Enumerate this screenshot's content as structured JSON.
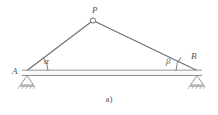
{
  "figure": {
    "caption": "a)",
    "type": "triangulation-diagram",
    "background_color": "#ffffff",
    "line_color": "#6e6e70",
    "text_color": "#59595b"
  },
  "vertices": [
    {
      "id": "P",
      "label": "P",
      "x": 93,
      "y": 20,
      "marker": "open-circle",
      "role": "apex-target-point"
    },
    {
      "id": "A",
      "label": "A",
      "x": 27,
      "y": 71,
      "marker": "pin-support",
      "role": "left-base-station"
    },
    {
      "id": "B",
      "label": "B",
      "x": 197,
      "y": 71,
      "marker": "pin-support",
      "role": "right-base-station"
    }
  ],
  "angles": [
    {
      "id": "alpha",
      "label": "α",
      "at_vertex": "A",
      "arc_radius": 21
    },
    {
      "id": "beta",
      "label": "β",
      "at_vertex": "B",
      "arc_radius": 21
    }
  ],
  "edges": [
    {
      "id": "AP",
      "from": "A",
      "to": "P",
      "style": "solid"
    },
    {
      "id": "PB",
      "from": "P",
      "to": "B",
      "style": "solid"
    },
    {
      "id": "AB",
      "from": "A",
      "to": "B",
      "style": "beam-double-line"
    }
  ],
  "baseline": {
    "id": "AB",
    "description": "baseline beam between supports A and B",
    "top_y": 70,
    "bottom_y": 75,
    "left_x": 27,
    "right_x": 197
  },
  "supports": [
    {
      "at_vertex": "A",
      "type": "triangle-pin-support",
      "hatch": true
    },
    {
      "at_vertex": "B",
      "type": "triangle-pin-support",
      "hatch": true
    }
  ]
}
